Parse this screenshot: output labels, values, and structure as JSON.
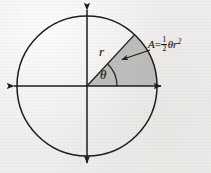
{
  "figure": {
    "name": "circle-sector-area-diagram",
    "background_color": "#efeeec",
    "ink_color": "#1b1b1b",
    "sector_fill_color": "#b9b9b7"
  },
  "geometry": {
    "center_x": 87,
    "center_y": 86,
    "radius": 70,
    "sector_start_angle_deg": 0,
    "sector_end_angle_deg": 35,
    "radius_line_end_x": 134,
    "radius_line_end_y": 38,
    "axis_left_x": 7,
    "axis_right_x": 168,
    "axis_top_y": 3,
    "axis_bottom_y": 170
  },
  "labels": {
    "radius": "r",
    "angle": "θ",
    "area_formula": {
      "lhs": "A",
      "equals": "=",
      "fraction_numerator": "1",
      "fraction_denominator": "2",
      "theta": "θ",
      "radius_symbol": "r",
      "exponent": "2",
      "plain": "A = 1/2 θr²"
    }
  },
  "annotations": {
    "leader_arrow": {
      "name": "area-leader-arrow",
      "from_x": 150,
      "from_y": 50,
      "to_x": 120,
      "to_y": 60
    }
  }
}
